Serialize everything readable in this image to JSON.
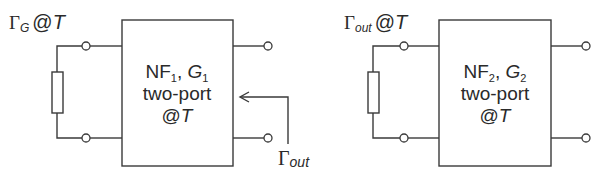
{
  "diagram": {
    "stage1": {
      "source_label": {
        "gamma": "Γ",
        "sub": "G",
        "suffix": "@",
        "temp": "T"
      },
      "box": {
        "line1": {
          "nf": "NF",
          "nf_sub": "1",
          "sep": ", ",
          "g": "G",
          "g_sub": "1"
        },
        "line2": "two-port",
        "line3": {
          "at": "@",
          "temp": "T"
        }
      },
      "output_reflection": {
        "gamma": "Γ",
        "sub": "out"
      }
    },
    "stage2": {
      "source_label": {
        "gamma": "Γ",
        "sub": "out",
        "suffix": "@",
        "temp": "T"
      },
      "box": {
        "line1": {
          "nf": "NF",
          "nf_sub": "2",
          "sep": ", ",
          "g": "G",
          "g_sub": "2"
        },
        "line2": "two-port",
        "line3": {
          "at": "@",
          "temp": "T"
        }
      }
    },
    "colors": {
      "stroke": "#3a3a3a",
      "text": "#2a2a2a",
      "background": "#ffffff"
    }
  }
}
